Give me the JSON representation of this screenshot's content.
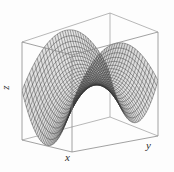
{
  "figure": {
    "kind": "3d-surface-wireframe",
    "background_color": "#fdfdfd",
    "frame_color": "#8a8a8a",
    "mesh_color": "#3a3a3a",
    "surface_fill": "#d8d8d8"
  },
  "axes": {
    "x_label": "x",
    "y_label": "y",
    "z_label": "z"
  },
  "chart_data": {
    "type": "surface",
    "title": "",
    "xlabel": "x",
    "ylabel": "y",
    "zlabel": "z",
    "surface_equation": "z = x^2 - y^2",
    "xlim": [
      -1,
      1
    ],
    "ylim": [
      -1,
      1
    ],
    "zlim": [
      -1,
      1
    ],
    "grid": false,
    "legend": null,
    "mesh_u_lines": 34,
    "mesh_v_lines": 34,
    "u_range": [
      -1,
      1
    ],
    "v_range": [
      -1,
      1
    ],
    "elevation_deg": 22,
    "azimuth_deg": -52,
    "box_vertices_px": {
      "top_back": [
        110,
        13
      ],
      "top_left": [
        22,
        42
      ],
      "top_front": [
        72,
        55
      ],
      "top_right": [
        158,
        32
      ],
      "bottom_back": [
        110,
        117
      ],
      "bottom_left": [
        22,
        140
      ],
      "bottom_front": [
        72,
        152
      ],
      "bottom_right": [
        158,
        136
      ]
    }
  }
}
